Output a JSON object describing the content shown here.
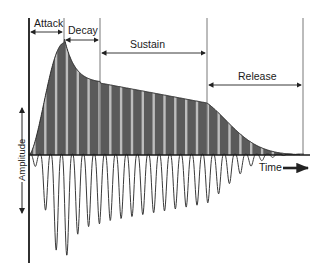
{
  "diagram": {
    "phases": [
      {
        "key": "attack",
        "label": "Attack"
      },
      {
        "key": "decay",
        "label": "Decay"
      },
      {
        "key": "sustain",
        "label": "Sustain"
      },
      {
        "key": "release",
        "label": "Release"
      }
    ],
    "axis_labels": {
      "amplitude": "Amplitude",
      "time": "Time"
    },
    "colors": {
      "envelope_fill": "#5a5a5a",
      "wave_stroke": "#3a3a3a",
      "axis": "#1a1a1a",
      "marker_line": "#555555",
      "light_stripe": "#bdbdbd"
    },
    "wave_cycles": 25
  }
}
